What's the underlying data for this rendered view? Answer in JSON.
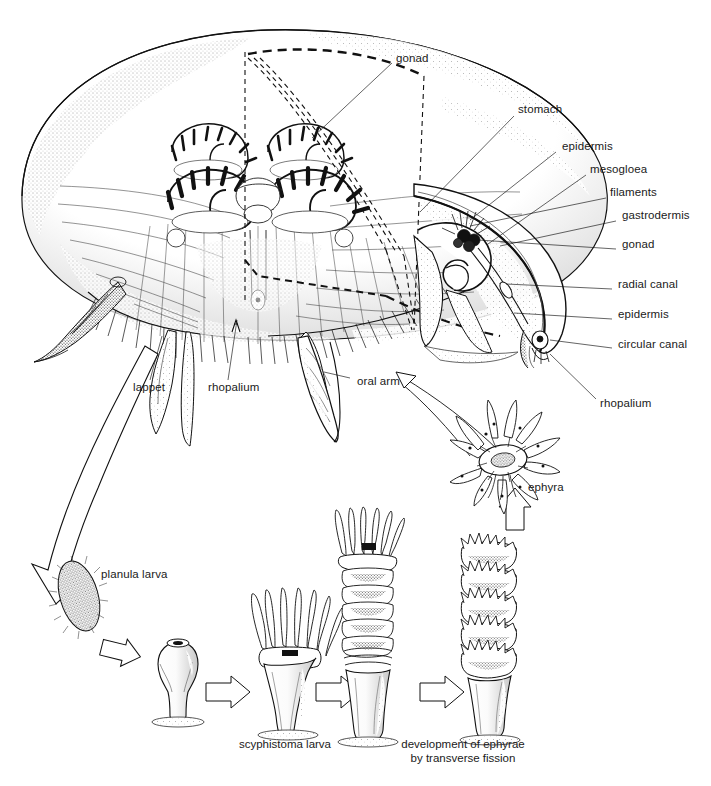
{
  "figure": {
    "ink_color": "#111111",
    "background_color": "#ffffff",
    "label_color": "#1a1a1a"
  },
  "anatomy_labels": [
    {
      "id": "gonad-top",
      "text": "gonad",
      "x": 396,
      "y": 59,
      "leader": [
        [
          392,
          65
        ],
        [
          310,
          140
        ]
      ]
    },
    {
      "id": "stomach",
      "text": "stomach",
      "x": 518,
      "y": 110,
      "leader": [
        [
          515,
          117
        ],
        [
          420,
          210
        ]
      ]
    },
    {
      "id": "epidermis-top",
      "text": "epidermis",
      "x": 562,
      "y": 147,
      "leader": [
        [
          558,
          153
        ],
        [
          470,
          218
        ]
      ]
    },
    {
      "id": "mesogloea",
      "text": "mesogloea",
      "x": 590,
      "y": 170,
      "leader": [
        [
          586,
          176
        ],
        [
          487,
          243
        ]
      ]
    },
    {
      "id": "filaments",
      "text": "filaments",
      "x": 610,
      "y": 193,
      "leader": [
        [
          606,
          199
        ],
        [
          468,
          224
        ]
      ]
    },
    {
      "id": "gastrodermis",
      "text": "gastrodermis",
      "x": 622,
      "y": 216,
      "leader": [
        [
          618,
          222
        ],
        [
          500,
          245
        ]
      ]
    },
    {
      "id": "gonad-side",
      "text": "gonad",
      "x": 622,
      "y": 245,
      "leader": [
        [
          618,
          250
        ],
        [
          474,
          239
        ]
      ]
    },
    {
      "id": "radial-canal",
      "text": "radial canal",
      "x": 618,
      "y": 285,
      "leader": [
        [
          614,
          290
        ],
        [
          505,
          283
        ]
      ]
    },
    {
      "id": "epidermis-low",
      "text": "epidermis",
      "x": 618,
      "y": 315,
      "leader": [
        [
          614,
          320
        ],
        [
          512,
          312
        ]
      ]
    },
    {
      "id": "circular-canal",
      "text": "circular canal",
      "x": 618,
      "y": 345,
      "leader": [
        [
          614,
          349
        ],
        [
          548,
          338
        ]
      ]
    },
    {
      "id": "rhopalium-cut",
      "text": "rhopalium",
      "x": 600,
      "y": 404,
      "leader": [
        [
          598,
          400
        ],
        [
          548,
          352
        ]
      ]
    },
    {
      "id": "lappet",
      "text": "lappet",
      "x": 133,
      "y": 388,
      "leader": [
        [
          148,
          382
        ],
        [
          160,
          338
        ]
      ]
    },
    {
      "id": "rhopalium-bell",
      "text": "rhopalium",
      "x": 208,
      "y": 388,
      "leader": [
        [
          224,
          382
        ],
        [
          236,
          318
        ]
      ]
    },
    {
      "id": "oral-arm",
      "text": "oral arm",
      "x": 355,
      "y": 382,
      "leader": [
        [
          352,
          379
        ],
        [
          325,
          372
        ]
      ]
    }
  ],
  "lifecycle_labels": [
    {
      "id": "ephyra",
      "text": "ephyra",
      "x": 528,
      "y": 488
    },
    {
      "id": "planula-larva",
      "text": "planula larva",
      "x": 101,
      "y": 575
    },
    {
      "id": "scyphistoma-larva",
      "text": "scyphistoma larva",
      "x": 220,
      "y": 743,
      "width": 130
    },
    {
      "id": "ephyrae-dev",
      "text": "development of ephyrae\nby transverse fission",
      "x": 378,
      "y": 743,
      "width": 160
    }
  ],
  "lifecycle_stages": [
    {
      "id": "planula",
      "name": "planula larva"
    },
    {
      "id": "young-polyp",
      "name": "settled young polyp"
    },
    {
      "id": "scyphistoma",
      "name": "scyphistoma larva"
    },
    {
      "id": "strobila-1",
      "name": "early strobila"
    },
    {
      "id": "strobila-2",
      "name": "late strobila"
    },
    {
      "id": "ephyra",
      "name": "ephyra"
    }
  ],
  "icons": {
    "arrow_medusa_to_planula": "curved-outline-arrow-icon",
    "arrow_ephyra_to_medusa": "curved-leader-arrow-icon",
    "arrow_stage": "block-arrow-icon",
    "arrow_strobila_to_ephyra": "block-arrow-up-icon",
    "cut_wedge": "dashed-wedge-cut-icon"
  }
}
